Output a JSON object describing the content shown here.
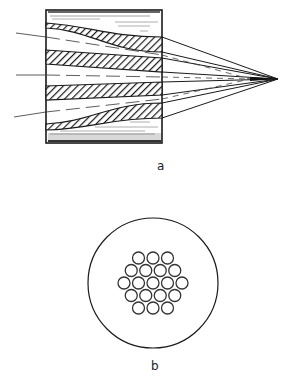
{
  "figure": {
    "panel_a": {
      "label": "a",
      "description": "Tapered fiber-optic bundle focusing rays to a point",
      "band_count": 4,
      "ray_count": 3,
      "converging_line_count": 8,
      "colors": {
        "ink": "#1a1a1a",
        "background": "#ffffff",
        "shade": "#555555"
      }
    },
    "panel_b": {
      "label": "b",
      "description": "Cross-section: hexagonal bundle of fibers inside a circular housing",
      "rows": [
        3,
        4,
        5,
        4,
        3
      ],
      "fiber_count": 19
    }
  }
}
